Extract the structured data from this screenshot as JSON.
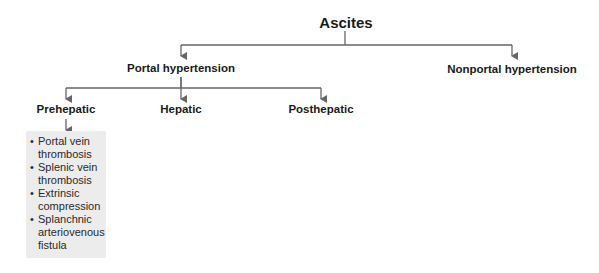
{
  "diagram": {
    "root": {
      "label": "Ascites"
    },
    "level1": [
      {
        "label": "Portal hypertension"
      },
      {
        "label": "Nonportal hypertension"
      }
    ],
    "level2": [
      {
        "label": "Prehepatic"
      },
      {
        "label": "Hepatic"
      },
      {
        "label": "Posthepatic"
      }
    ],
    "prehepatic_causes": [
      "Portal vein thrombosis",
      "Splenic vein thrombosis",
      "Extrinsic compression",
      "Splanchnic arteriovenous fistula"
    ],
    "colors": {
      "line": "#666666",
      "box_bg": "#ececec",
      "text": "#1a1a1a"
    }
  }
}
